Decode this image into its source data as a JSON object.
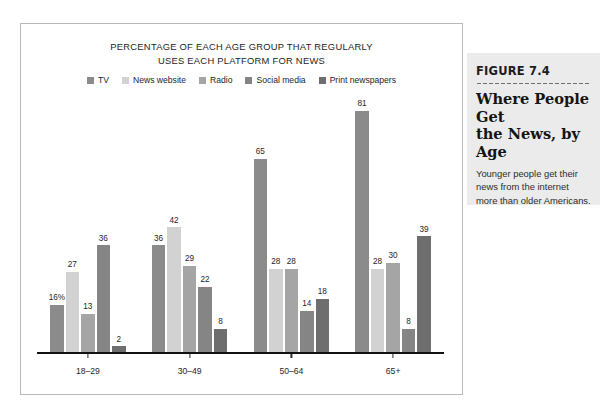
{
  "chart_data": {
    "type": "bar",
    "title": "PERCENTAGE OF EACH AGE GROUP THAT REGULARLY\nUSES EACH PLATFORM FOR NEWS",
    "xlabel": "",
    "ylabel": "",
    "ylim": [
      0,
      85
    ],
    "grid": false,
    "legend_position": "top-center",
    "categories": [
      "18–29",
      "30–49",
      "50–64",
      "65+"
    ],
    "series": [
      {
        "name": "TV",
        "color": "#8b8b8b",
        "values": [
          16,
          36,
          65,
          81
        ],
        "labels": [
          "16%",
          "36",
          "65",
          "81"
        ]
      },
      {
        "name": "News website",
        "color": "#d2d2d2",
        "values": [
          27,
          42,
          28,
          28
        ],
        "labels": [
          "27",
          "42",
          "28",
          "28"
        ]
      },
      {
        "name": "Radio",
        "color": "#a5a5a5",
        "values": [
          13,
          29,
          28,
          30
        ],
        "labels": [
          "13",
          "29",
          "28",
          "30"
        ]
      },
      {
        "name": "Social media",
        "color": "#858585",
        "values": [
          36,
          22,
          14,
          8
        ],
        "labels": [
          "36",
          "22",
          "14",
          "8"
        ]
      },
      {
        "name": "Print newspapers",
        "color": "#6e6e6e",
        "values": [
          2,
          8,
          18,
          39
        ],
        "labels": [
          "2",
          "8",
          "18",
          "39"
        ]
      }
    ]
  },
  "caption": {
    "figure_number": "FIGURE 7.4",
    "heading": "Where People Get\nthe News, by Age",
    "body": "Younger people get their news from the internet more than older Americans. What does this trend mean for the future of other news media?"
  }
}
